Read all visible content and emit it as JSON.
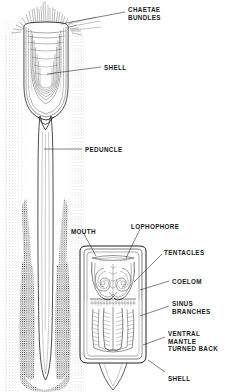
{
  "figure": {
    "background_color": "#ffffff",
    "ink_color": "#1a1a1a",
    "style": "black-and-white stippled line engraving"
  },
  "labels": [
    {
      "id": "chaetae-bundles",
      "lines": [
        "CHAETAE",
        "BUNDLES"
      ],
      "text": "CHAETAE BUNDLES",
      "x": 128,
      "y": 6
    },
    {
      "id": "shell-upper",
      "lines": [
        "SHELL"
      ],
      "text": "SHELL",
      "x": 104,
      "y": 64
    },
    {
      "id": "peduncle",
      "lines": [
        "PEDUNCLE"
      ],
      "text": "PEDUNCLE",
      "x": 85,
      "y": 146
    },
    {
      "id": "mouth",
      "lines": [
        "MOUTH"
      ],
      "text": "MOUTH",
      "x": 71,
      "y": 228
    },
    {
      "id": "lophophore",
      "lines": [
        "LOPHOPHORE"
      ],
      "text": "LOPHOPHORE",
      "x": 131,
      "y": 223
    },
    {
      "id": "tentacles",
      "lines": [
        "TENTACLES"
      ],
      "text": "TENTACLES",
      "x": 164,
      "y": 249
    },
    {
      "id": "coelom",
      "lines": [
        "COELOM"
      ],
      "text": "COELOM",
      "x": 172,
      "y": 278
    },
    {
      "id": "sinus-branches",
      "lines": [
        "SINUS",
        "BRANCHES"
      ],
      "text": "SINUS BRANCHES",
      "x": 172,
      "y": 300
    },
    {
      "id": "ventral-mantle",
      "lines": [
        "VENTRAL",
        "MANTLE",
        "TURNED BACK"
      ],
      "text": "VENTRAL MANTLE TURNED BACK",
      "x": 168,
      "y": 330
    },
    {
      "id": "shell-lower",
      "lines": [
        "SHELL"
      ],
      "text": "SHELL",
      "x": 168,
      "y": 375
    }
  ],
  "leaders": [
    {
      "id": "leader-chaetae-bundles",
      "from": [
        125,
        12
      ],
      "to": [
        61,
        24
      ]
    },
    {
      "id": "leader-shell-upper",
      "from": [
        101,
        67
      ],
      "to": [
        47,
        74
      ]
    },
    {
      "id": "leader-peduncle",
      "from": [
        82,
        149
      ],
      "to": [
        44,
        149
      ]
    },
    {
      "id": "leader-mouth",
      "from": [
        84,
        234
      ],
      "to": [
        96,
        256
      ]
    },
    {
      "id": "leader-lophophore",
      "from": [
        140,
        229
      ],
      "to": [
        126,
        258
      ]
    },
    {
      "id": "leader-tentacles",
      "from": [
        162,
        254
      ],
      "to": [
        134,
        282
      ]
    },
    {
      "id": "leader-coelom",
      "from": [
        169,
        281
      ],
      "to": [
        140,
        290
      ]
    },
    {
      "id": "leader-sinus-branches",
      "from": [
        169,
        306
      ],
      "to": [
        140,
        316
      ]
    },
    {
      "id": "leader-ventral-mantle",
      "from": [
        165,
        337
      ],
      "to": [
        143,
        345
      ]
    },
    {
      "id": "leader-shell-lower",
      "from": [
        165,
        372
      ],
      "to": [
        148,
        360
      ]
    }
  ],
  "anatomy": {
    "burrow": {
      "description": "stippled sediment burrow walls",
      "x_range": [
        4,
        84
      ]
    },
    "upper_shell": {
      "description": "valve with concentric growth lines",
      "cx": 46,
      "top": 22,
      "bottom": 120
    },
    "peduncle": {
      "description": "long tapering pedicle",
      "cx": 46,
      "top": 118,
      "bottom": 382
    },
    "dark_sediment": {
      "description": "dark stippled masses flanking peduncle"
    },
    "lower_diagram": {
      "description": "enlarged dissected valve, ventral mantle turned back",
      "box": [
        78,
        245,
        70,
        120
      ],
      "parts": [
        "lophophore spirals",
        "mouth",
        "tentacles",
        "coelom",
        "sinus branches",
        "shell margin",
        "pedicle"
      ]
    }
  }
}
